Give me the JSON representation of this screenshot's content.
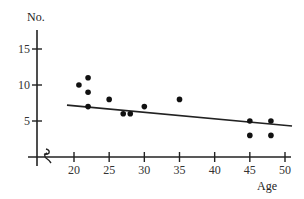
{
  "chart_data": {
    "type": "scatter",
    "title": "",
    "xlabel": "Age",
    "ylabel": "No.",
    "xlim": [
      15,
      51
    ],
    "ylim": [
      0,
      17
    ],
    "x_ticks": [
      20,
      25,
      30,
      35,
      40,
      45,
      50
    ],
    "y_ticks": [
      5,
      10,
      15
    ],
    "axis_break": true,
    "grid": false,
    "legend": null,
    "points": [
      {
        "x": 20.7,
        "y": 10
      },
      {
        "x": 22,
        "y": 11
      },
      {
        "x": 22,
        "y": 9
      },
      {
        "x": 22,
        "y": 7
      },
      {
        "x": 25,
        "y": 8
      },
      {
        "x": 27,
        "y": 6
      },
      {
        "x": 28,
        "y": 6
      },
      {
        "x": 30,
        "y": 7
      },
      {
        "x": 35,
        "y": 8
      },
      {
        "x": 45,
        "y": 5
      },
      {
        "x": 45,
        "y": 3
      },
      {
        "x": 48,
        "y": 5
      },
      {
        "x": 48,
        "y": 3
      }
    ],
    "trend_line": {
      "x1": 19,
      "y1": 7.2,
      "x2": 51,
      "y2": 4.3
    }
  },
  "labels": {
    "y_axis": "No.",
    "x_axis": "Age",
    "x_ticks": [
      "20",
      "25",
      "30",
      "35",
      "40",
      "45",
      "50"
    ],
    "y_ticks": [
      "5",
      "10",
      "15"
    ]
  }
}
